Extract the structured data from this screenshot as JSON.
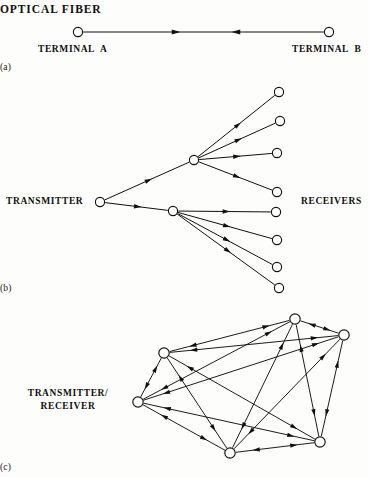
{
  "figure": {
    "background_color": "#fdfdfb",
    "line_color": "#101010",
    "node_fill": "#ffffff",
    "node_stroke": "#101010"
  },
  "panel_a": {
    "title": "OPTICAL FIBER",
    "caption": "(a)",
    "left_label": "TERMINAL  A",
    "right_label": "TERMINAL  B",
    "nodes": [
      {
        "id": "terminal-a",
        "x": 78,
        "y": 32,
        "r": 4.6
      },
      {
        "id": "terminal-b",
        "x": 329,
        "y": 32,
        "r": 4.6
      }
    ],
    "links": [
      {
        "from": "terminal-a",
        "to": "terminal-b",
        "arrows": [
          {
            "x": 176,
            "dir": "right"
          },
          {
            "x": 236,
            "dir": "left"
          }
        ]
      }
    ]
  },
  "panel_b": {
    "caption": "(b)",
    "left_label": "TRANSMITTER",
    "right_label": "RECEIVERS",
    "nodes": [
      {
        "id": "transmitter",
        "x": 100,
        "y": 202,
        "r": 4.6
      },
      {
        "id": "hub-upper",
        "x": 194,
        "y": 160,
        "r": 4.6
      },
      {
        "id": "hub-lower",
        "x": 173,
        "y": 211,
        "r": 4.6
      },
      {
        "id": "rx-1",
        "x": 279,
        "y": 92,
        "r": 4.6
      },
      {
        "id": "rx-2",
        "x": 280,
        "y": 121,
        "r": 4.6
      },
      {
        "id": "rx-3",
        "x": 277,
        "y": 153,
        "r": 4.6
      },
      {
        "id": "rx-4",
        "x": 277,
        "y": 192,
        "r": 4.6
      },
      {
        "id": "rx-5",
        "x": 276,
        "y": 212,
        "r": 4.6
      },
      {
        "id": "rx-6",
        "x": 277,
        "y": 240,
        "r": 4.6
      },
      {
        "id": "rx-7",
        "x": 277,
        "y": 267,
        "r": 4.6
      },
      {
        "id": "rx-8",
        "x": 279,
        "y": 288,
        "r": 4.6
      }
    ],
    "links": [
      {
        "from": "transmitter",
        "to": "hub-upper"
      },
      {
        "from": "transmitter",
        "to": "hub-lower"
      },
      {
        "from": "hub-upper",
        "to": "rx-1"
      },
      {
        "from": "hub-upper",
        "to": "rx-2"
      },
      {
        "from": "hub-upper",
        "to": "rx-3"
      },
      {
        "from": "hub-upper",
        "to": "rx-4"
      },
      {
        "from": "hub-lower",
        "to": "rx-5"
      },
      {
        "from": "hub-lower",
        "to": "rx-6"
      },
      {
        "from": "hub-lower",
        "to": "rx-7"
      },
      {
        "from": "hub-lower",
        "to": "rx-8"
      }
    ]
  },
  "panel_c": {
    "caption": "(c)",
    "left_label_line1": "TRANSMITTER/",
    "left_label_line2": "RECEIVER",
    "nodes": [
      {
        "id": "n-top",
        "x": 295,
        "y": 319,
        "r": 5.2
      },
      {
        "id": "n-right-top",
        "x": 344,
        "y": 335,
        "r": 5.2
      },
      {
        "id": "n-upper-left",
        "x": 164,
        "y": 353,
        "r": 5.2
      },
      {
        "id": "n-left",
        "x": 138,
        "y": 402,
        "r": 5.2
      },
      {
        "id": "n-bottom",
        "x": 230,
        "y": 453,
        "r": 5.2
      },
      {
        "id": "n-right-bottom",
        "x": 320,
        "y": 442,
        "r": 5.2
      }
    ],
    "links": [
      {
        "from": "n-upper-left",
        "to": "n-top"
      },
      {
        "from": "n-upper-left",
        "to": "n-right-top"
      },
      {
        "from": "n-upper-left",
        "to": "n-left"
      },
      {
        "from": "n-upper-left",
        "to": "n-bottom"
      },
      {
        "from": "n-upper-left",
        "to": "n-right-bottom"
      },
      {
        "from": "n-top",
        "to": "n-right-top"
      },
      {
        "from": "n-top",
        "to": "n-left"
      },
      {
        "from": "n-top",
        "to": "n-bottom"
      },
      {
        "from": "n-top",
        "to": "n-right-bottom"
      },
      {
        "from": "n-right-top",
        "to": "n-left"
      },
      {
        "from": "n-right-top",
        "to": "n-bottom"
      },
      {
        "from": "n-right-top",
        "to": "n-right-bottom"
      },
      {
        "from": "n-left",
        "to": "n-bottom"
      },
      {
        "from": "n-left",
        "to": "n-right-bottom"
      },
      {
        "from": "n-bottom",
        "to": "n-right-bottom"
      }
    ]
  }
}
